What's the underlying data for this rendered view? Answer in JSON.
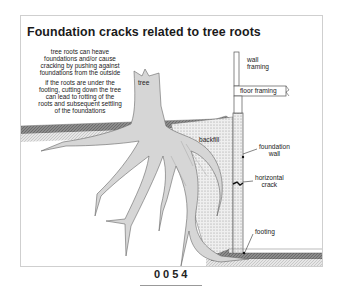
{
  "diagram": {
    "title": "Foundation cracks related to tree roots",
    "notes": [
      "tree roots can heave\nfoundations and/or cause\ncracking by pushing against\nfoundations from the outside",
      "if the roots are under the\nfooting, cutting down the tree\ncan lead to rotting of the\nroots and subsequent settling\nof the foundations"
    ],
    "labels": {
      "tree": "tree",
      "wall_framing": "wall\nframing",
      "floor_framing": "floor framing",
      "backfill": "backfill",
      "foundation_wall": "foundation\nwall",
      "horizontal_crack": "horizontal\ncrack",
      "footing": "footing"
    },
    "colors": {
      "tree": "#d6d6d6",
      "soil_band": "#9a9a9a",
      "soil_light": "#e2e2e2",
      "outline": "#555555"
    }
  },
  "page": {
    "number": "0054"
  }
}
